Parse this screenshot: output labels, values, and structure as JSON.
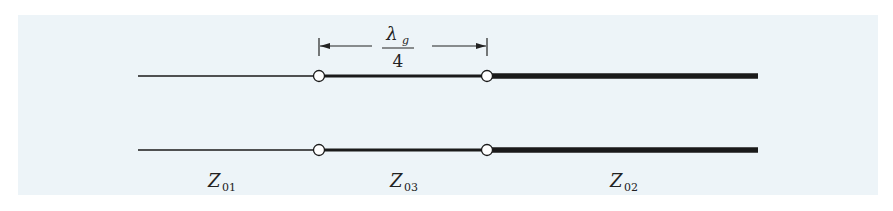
{
  "diagram": {
    "dimension": {
      "numerator": "λ",
      "numerator_sub": "g",
      "denominator": "4"
    },
    "sections": [
      {
        "label": "Z",
        "sub": "01",
        "thickness": "thin"
      },
      {
        "label": "Z",
        "sub": "03",
        "thickness": "medium"
      },
      {
        "label": "Z",
        "sub": "02",
        "thickness": "thick"
      }
    ],
    "colors": {
      "background": "#edf4f8",
      "line": "#1a1a1a"
    }
  }
}
